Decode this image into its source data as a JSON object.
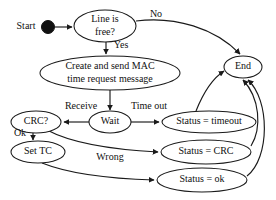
{
  "diagram": {
    "stroke_color": "#1a1a1a",
    "text_color": "#111111",
    "background_color": "#ffffff",
    "nodes": [
      {
        "id": "start",
        "label": "Start",
        "shape": "label-with-filled-dot",
        "cx": 48,
        "cy": 27,
        "rx": 0,
        "ry": 0
      },
      {
        "id": "line_free",
        "label_line1": "Line is",
        "label_line2": "free?",
        "shape": "ellipse",
        "cx": 105,
        "cy": 26,
        "rx": 31,
        "ry": 16
      },
      {
        "id": "create_send",
        "label_line1": "Create and send MAC",
        "label_line2": "time request message",
        "shape": "ellipse",
        "cx": 110,
        "cy": 73,
        "rx": 70,
        "ry": 17
      },
      {
        "id": "wait",
        "label": "Wait",
        "shape": "ellipse",
        "cx": 110,
        "cy": 122,
        "rx": 21,
        "ry": 11
      },
      {
        "id": "crc",
        "label": "CRC?",
        "shape": "ellipse",
        "cx": 36,
        "cy": 122,
        "rx": 25,
        "ry": 11
      },
      {
        "id": "set_tc",
        "label": "Set TC",
        "shape": "ellipse",
        "cx": 38,
        "cy": 152,
        "rx": 27,
        "ry": 11
      },
      {
        "id": "status_timeout",
        "label": "Status = timeout",
        "shape": "ellipse",
        "cx": 209,
        "cy": 122,
        "rx": 47,
        "ry": 11
      },
      {
        "id": "status_crc",
        "label": "Status = CRC",
        "shape": "ellipse",
        "cx": 206,
        "cy": 152,
        "rx": 45,
        "ry": 12
      },
      {
        "id": "status_ok",
        "label": "Status = ok",
        "shape": "ellipse",
        "cx": 202,
        "cy": 180,
        "rx": 45,
        "ry": 12
      },
      {
        "id": "end",
        "label": "End",
        "shape": "ellipse",
        "cx": 243,
        "cy": 67,
        "rx": 19,
        "ry": 11
      }
    ],
    "edges": [
      {
        "id": "start-to-line",
        "from": "start",
        "to": "line_free",
        "label": ""
      },
      {
        "id": "line-no-to-end",
        "from": "line_free",
        "to": "end",
        "label": "No"
      },
      {
        "id": "line-yes-to-create",
        "from": "line_free",
        "to": "create_send",
        "label": "Yes"
      },
      {
        "id": "create-to-wait",
        "from": "create_send",
        "to": "wait",
        "label": ""
      },
      {
        "id": "wait-receive-to-crc",
        "from": "wait",
        "to": "crc",
        "label": "Receive"
      },
      {
        "id": "wait-timeout-to-status",
        "from": "wait",
        "to": "status_timeout",
        "label": "Time out"
      },
      {
        "id": "crc-ok-to-settc",
        "from": "crc",
        "to": "set_tc",
        "label": "Ok"
      },
      {
        "id": "crc-wrong-to-statuscrc",
        "from": "crc",
        "to": "status_crc",
        "label": "Wrong"
      },
      {
        "id": "settc-to-statusok",
        "from": "set_tc",
        "to": "status_ok",
        "label": ""
      },
      {
        "id": "statustimeout-to-end",
        "from": "status_timeout",
        "to": "end",
        "label": ""
      },
      {
        "id": "statuscrc-to-end",
        "from": "status_crc",
        "to": "end",
        "label": ""
      },
      {
        "id": "statusok-to-end",
        "from": "status_ok",
        "to": "end",
        "label": ""
      }
    ],
    "labels": {
      "start": "Start",
      "line_free_1": "Line is",
      "line_free_2": "free?",
      "no": "No",
      "yes": "Yes",
      "create_1": "Create and send MAC",
      "create_2": "time request message",
      "receive": "Receive",
      "time_out": "Time out",
      "wait": "Wait",
      "crc": "CRC?",
      "ok": "Ok",
      "wrong": "Wrong",
      "set_tc": "Set TC",
      "status_timeout": "Status = timeout",
      "status_crc": "Status = CRC",
      "status_ok": "Status = ok",
      "end": "End"
    }
  }
}
